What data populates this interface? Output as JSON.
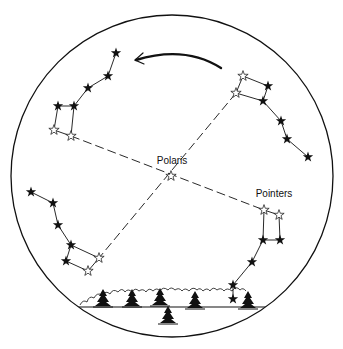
{
  "diagram": {
    "labels": {
      "polaris": "Polaris",
      "pointers": "Pointers"
    },
    "colors": {
      "ink": "#111111",
      "background": "#ffffff"
    },
    "sky_circle": {
      "cx": 172,
      "cy": 176,
      "r": 161
    },
    "polaris": {
      "x": 171,
      "y": 176
    },
    "rotation_arrow": {
      "direction": "counterclockwise",
      "from": [
        221,
        68
      ],
      "to": [
        135,
        60
      ]
    },
    "dippers": [
      {
        "name": "upper-left",
        "filled_stars": [
          [
            116,
            53
          ],
          [
            108,
            76
          ],
          [
            88,
            88
          ],
          [
            74,
            106
          ],
          [
            58,
            106
          ]
        ],
        "hollow_stars": [
          [
            54,
            130
          ],
          [
            71,
            136
          ]
        ]
      },
      {
        "name": "upper-right",
        "filled_stars": [
          [
            268,
            86
          ],
          [
            263,
            101
          ],
          [
            281,
            121
          ],
          [
            287,
            139
          ],
          [
            308,
            157
          ]
        ],
        "hollow_stars": [
          [
            243,
            76
          ],
          [
            236,
            93
          ]
        ]
      },
      {
        "name": "lower-left",
        "filled_stars": [
          [
            31,
            192
          ],
          [
            53,
            203
          ],
          [
            58,
            225
          ],
          [
            71,
            245
          ],
          [
            66,
            261
          ]
        ],
        "hollow_stars": [
          [
            99,
            258
          ],
          [
            88,
            271
          ]
        ]
      },
      {
        "name": "lower-right",
        "filled_stars": [
          [
            263,
            240
          ],
          [
            280,
            240
          ],
          [
            252,
            262
          ],
          [
            233,
            285
          ],
          [
            233,
            299
          ]
        ],
        "hollow_stars": [
          [
            264,
            210
          ],
          [
            279,
            215
          ]
        ]
      }
    ],
    "horizon": {
      "y": 307,
      "x1": 77,
      "x2": 266
    },
    "trees": [
      [
        103,
        305
      ],
      [
        132,
        305
      ],
      [
        160,
        304
      ],
      [
        168,
        322
      ],
      [
        195,
        307
      ],
      [
        248,
        307
      ]
    ]
  }
}
